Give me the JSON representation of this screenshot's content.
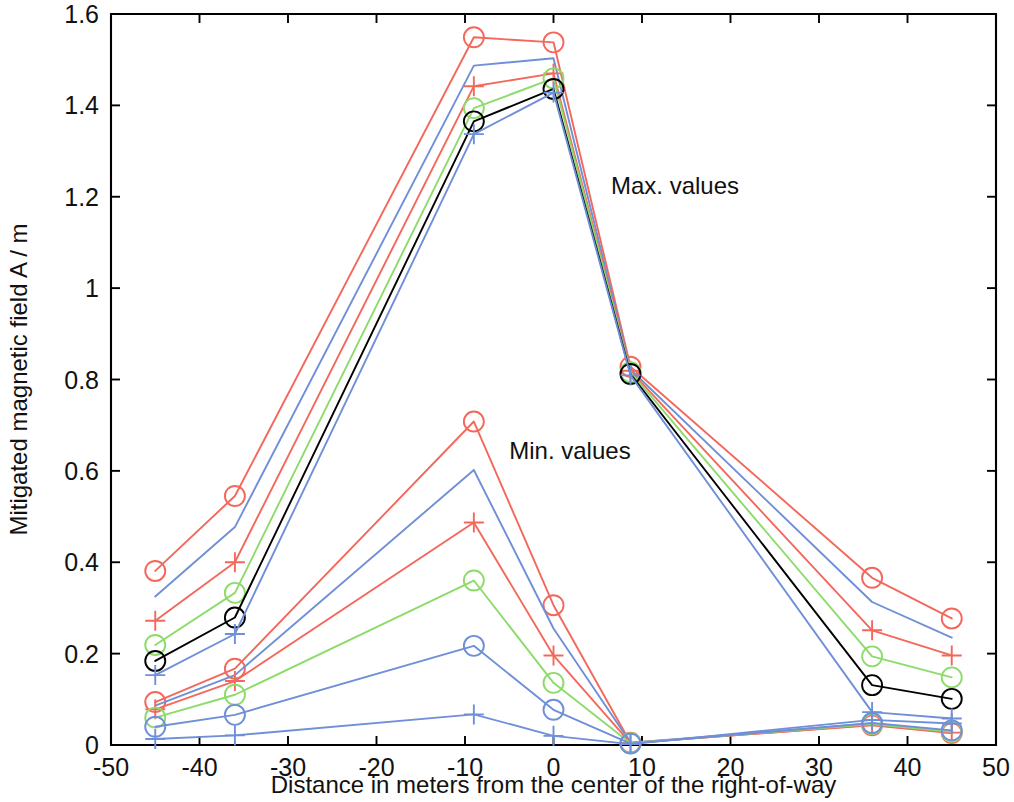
{
  "figure": {
    "title": "",
    "background_color": "#ffffff",
    "plot_box": {
      "left": 111,
      "top": 14,
      "right": 996,
      "bottom": 745
    }
  },
  "annotations": [
    {
      "name": "max-values-label",
      "text": "Max. values",
      "x": 6.5,
      "y": 1.205
    },
    {
      "name": "min-values-label",
      "text": "Min. values",
      "x": -5.0,
      "y": 0.625
    }
  ],
  "colors": {
    "black": "#000000",
    "red": "#f4685c",
    "green": "#8ddb6a",
    "blue": "#6f8fd8",
    "axis": "#000000",
    "text": "#111111"
  },
  "chart_data": {
    "type": "line",
    "title": "",
    "xlabel": "Distance in meters from the center of the right-of-way",
    "ylabel": "Mitigated magnetic field A / m",
    "xlim": [
      -50,
      50
    ],
    "ylim": [
      0,
      1.6
    ],
    "xticks": [
      -50,
      -40,
      -30,
      -20,
      -10,
      0,
      10,
      20,
      30,
      40,
      50
    ],
    "xticklabels": [
      "-50",
      "-40",
      "-30",
      "-20",
      "-10",
      "0",
      "10",
      "20",
      "30",
      "40",
      "50"
    ],
    "yticks": [
      0,
      0.2,
      0.4,
      0.6,
      0.8,
      1,
      1.2,
      1.4,
      1.6
    ],
    "yticklabels": [
      "0",
      "0.2",
      "0.4",
      "0.6",
      "0.8",
      "1",
      "1.2",
      "1.4",
      "1.6"
    ],
    "grid": false,
    "legend": false,
    "x": [
      -45,
      -36,
      -9,
      0,
      8.7,
      36,
      45
    ],
    "groups": [
      {
        "name": "Max. values",
        "series": [
          {
            "name": "max-red-circle",
            "color": "#f4685c",
            "marker": "circle",
            "values": [
              0.381,
              0.545,
              1.549,
              1.538,
              0.828,
              0.366,
              0.277
            ]
          },
          {
            "name": "max-blue-plain-upper",
            "color": "#6f8fd8",
            "marker": "none",
            "values": [
              0.325,
              0.477,
              1.487,
              1.503,
              0.822,
              0.313,
              0.235
            ]
          },
          {
            "name": "max-red-plus",
            "color": "#f4685c",
            "marker": "plus",
            "values": [
              0.272,
              0.4,
              1.442,
              1.47,
              0.819,
              0.251,
              0.196
            ]
          },
          {
            "name": "max-green-circle",
            "color": "#8ddb6a",
            "marker": "circle",
            "values": [
              0.219,
              0.333,
              1.394,
              1.459,
              0.816,
              0.194,
              0.148
            ]
          },
          {
            "name": "max-black-circle",
            "color": "#000000",
            "marker": "circle",
            "values": [
              0.184,
              0.279,
              1.365,
              1.436,
              0.812,
              0.131,
              0.101
            ]
          },
          {
            "name": "max-blue-plus",
            "color": "#6f8fd8",
            "marker": "plus",
            "values": [
              0.153,
              0.243,
              1.337,
              1.428,
              0.809,
              0.072,
              0.058
            ]
          }
        ]
      },
      {
        "name": "Min. values",
        "series": [
          {
            "name": "min-red-circle",
            "color": "#f4685c",
            "marker": "circle",
            "values": [
              0.094,
              0.167,
              0.708,
              0.306,
              0.005,
              0.043,
              0.026
            ]
          },
          {
            "name": "min-blue-plain-upper",
            "color": "#6f8fd8",
            "marker": "none",
            "values": [
              0.086,
              0.153,
              0.602,
              0.255,
              0.005,
              0.047,
              0.03
            ]
          },
          {
            "name": "min-red-plus",
            "color": "#f4685c",
            "marker": "plus",
            "values": [
              0.078,
              0.14,
              0.487,
              0.196,
              0.004,
              0.044,
              0.027
            ]
          },
          {
            "name": "min-green-circle",
            "color": "#8ddb6a",
            "marker": "circle",
            "values": [
              0.06,
              0.11,
              0.36,
              0.136,
              0.004,
              0.046,
              0.029
            ]
          },
          {
            "name": "min-blue-circle",
            "color": "#6f8fd8",
            "marker": "circle",
            "values": [
              0.04,
              0.066,
              0.217,
              0.077,
              0.003,
              0.048,
              0.032
            ]
          },
          {
            "name": "min-blue-plus",
            "color": "#6f8fd8",
            "marker": "plus",
            "values": [
              0.013,
              0.021,
              0.067,
              0.02,
              0.002,
              0.055,
              0.047
            ]
          }
        ]
      }
    ]
  }
}
